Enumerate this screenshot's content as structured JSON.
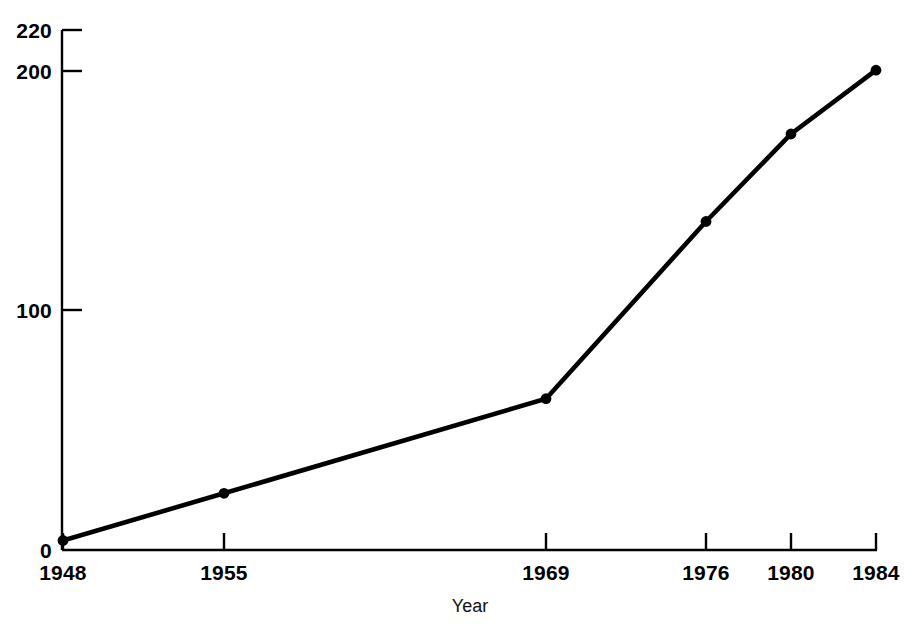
{
  "chart_data": {
    "type": "line",
    "title": "",
    "subtitle": "",
    "xlabel": "Year",
    "ylabel": "",
    "x": [
      1948,
      1955,
      1969,
      1976,
      1980,
      1984
    ],
    "x_tick_labels": [
      "1948",
      "1955",
      "1969",
      "1976",
      "1980",
      "1984"
    ],
    "values": [
      4,
      24,
      64,
      139,
      176,
      203
    ],
    "series": [
      {
        "name": "",
        "values": [
          4,
          24,
          64,
          139,
          176,
          203
        ]
      }
    ],
    "y_tick_labels": [
      "220",
      "200",
      "100",
      "0"
    ],
    "y_ticks": [
      220,
      200,
      100,
      0
    ],
    "xlim": [
      1948,
      1984
    ],
    "ylim": [
      0,
      220
    ],
    "grid": false,
    "legend": "none",
    "marker": "filled-circle",
    "line_color": "#000000",
    "marker_color": "#000000",
    "axis_color": "#000000",
    "background_color": "#ffffff"
  },
  "axes": {
    "x_axis_name": "x-axis",
    "y_axis_name": "y-axis"
  }
}
